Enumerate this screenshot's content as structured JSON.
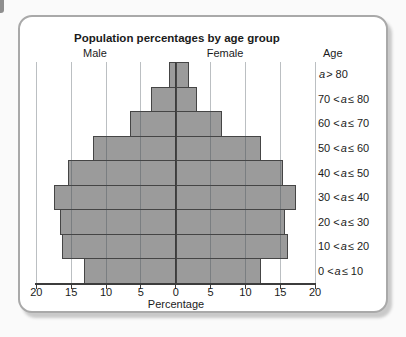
{
  "chart_data": {
    "type": "bar",
    "subtype": "population-pyramid",
    "title": "Population percentages by age group",
    "left_series_label": "Male",
    "right_series_label": "Female",
    "age_column_header": "Age",
    "xlabel": "Percentage",
    "x_tick_labels": [
      "20",
      "15",
      "10",
      "5",
      "0",
      "5",
      "10",
      "15",
      "20"
    ],
    "x_max_each_side": 20,
    "grid": true,
    "age_groups": [
      {
        "pre": "",
        "var": "a",
        "suf": " > 80",
        "label": "a > 80"
      },
      {
        "pre": "70 < ",
        "var": "a",
        "suf": " ≤ 80",
        "label": "70 < a ≤ 80"
      },
      {
        "pre": "60 < ",
        "var": "a",
        "suf": " ≤ 70",
        "label": "60 < a ≤ 70"
      },
      {
        "pre": "50 < ",
        "var": "a",
        "suf": " ≤ 60",
        "label": "50 < a ≤ 60"
      },
      {
        "pre": "40 < ",
        "var": "a",
        "suf": " ≤ 50",
        "label": "40 < a ≤ 50"
      },
      {
        "pre": "30 < ",
        "var": "a",
        "suf": " ≤ 40",
        "label": "30 < a ≤ 40"
      },
      {
        "pre": "20 < ",
        "var": "a",
        "suf": " ≤ 30",
        "label": "20 < a ≤ 30"
      },
      {
        "pre": "10 < ",
        "var": "a",
        "suf": " ≤ 20",
        "label": "10 < a ≤ 20"
      },
      {
        "pre": "0 < ",
        "var": "a",
        "suf": " ≤ 10",
        "label": "0 < a ≤ 10"
      }
    ],
    "series": [
      {
        "name": "Male",
        "side": "left",
        "values": [
          1.0,
          3.6,
          6.5,
          11.8,
          15.4,
          17.5,
          16.6,
          16.3,
          13.2
        ]
      },
      {
        "name": "Female",
        "side": "right",
        "values": [
          1.8,
          2.9,
          6.5,
          12.1,
          15.2,
          17.1,
          15.6,
          16.0,
          12.1
        ]
      }
    ],
    "colors": {
      "bar_fill": "#9b9b9b",
      "bar_border": "#454545",
      "grid": "#c2c8cb",
      "axis": "#3c3c3c",
      "card_border": "#a9a9a9"
    }
  }
}
